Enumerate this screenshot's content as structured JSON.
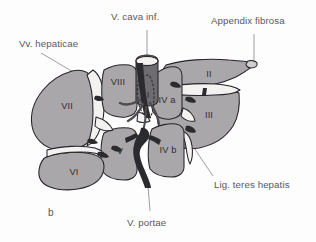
{
  "figure": {
    "panel_label": "b",
    "background_color": "#fdfdfd",
    "outline_color": "#26242a",
    "segment_fill_color": "#a9a7a9",
    "vessel_dark_color": "#2b2a2e",
    "vessel_white_color": "#f3f2f0",
    "label_color": "#555356"
  },
  "callouts": [
    {
      "id": "v-cava-inf",
      "text": "V. cava inf."
    },
    {
      "id": "appendix-fibrosa",
      "text": "Appendix fibrosa"
    },
    {
      "id": "vv-hepaticae",
      "text": "Vv. hepaticae"
    },
    {
      "id": "lig-teres-hepatis",
      "text": "Lig. teres hepatis"
    },
    {
      "id": "v-portae",
      "text": "V. portae"
    }
  ],
  "segments": [
    {
      "id": "segment-1",
      "text": "I"
    },
    {
      "id": "segment-2",
      "text": "II"
    },
    {
      "id": "segment-3",
      "text": "III"
    },
    {
      "id": "segment-4a",
      "text": "IV a"
    },
    {
      "id": "segment-4b",
      "text": "IV b"
    },
    {
      "id": "segment-5",
      "text": "V"
    },
    {
      "id": "segment-6",
      "text": "VI"
    },
    {
      "id": "segment-7",
      "text": "VII"
    },
    {
      "id": "segment-8",
      "text": "VIII"
    }
  ]
}
